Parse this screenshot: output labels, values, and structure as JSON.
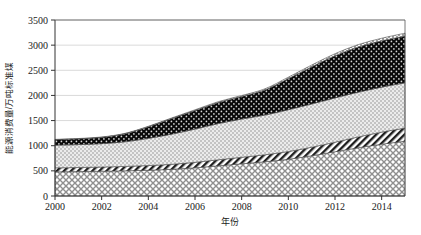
{
  "chart_data": {
    "type": "area",
    "title": "",
    "xlabel": "年份",
    "ylabel": "能源消费量/万吨标准煤",
    "x": [
      2000,
      2001,
      2002,
      2003,
      2004,
      2005,
      2006,
      2007,
      2008,
      2009,
      2010,
      2011,
      2012,
      2013,
      2014,
      2015
    ],
    "xlim": [
      2000,
      2015
    ],
    "ylim": [
      0,
      3500
    ],
    "yticks": [
      0,
      500,
      1000,
      1500,
      2000,
      2500,
      3000,
      3500
    ],
    "xticks": [
      2000,
      2002,
      2004,
      2006,
      2008,
      2010,
      2012,
      2014
    ],
    "xtick_labels": [
      "2000",
      "2002",
      "2004",
      "2006",
      "2008",
      "2010",
      "2012",
      "2014"
    ],
    "ytick_labels": [
      "0",
      "500",
      "1000",
      "1500",
      "2000",
      "2500",
      "3000",
      "3500"
    ],
    "grid": "horizontal",
    "legend": "none",
    "stacked": true,
    "series": [
      {
        "name": "layer-1-crosshatch",
        "pattern": "cross-hatch",
        "color": "#c9c9c9",
        "values": [
          480,
          485,
          492,
          500,
          512,
          530,
          560,
          600,
          640,
          680,
          730,
          800,
          880,
          960,
          1030,
          1090
        ]
      },
      {
        "name": "layer-2-diagonal-stripes",
        "pattern": "diagonal-stripes",
        "color": "#3a3a3a",
        "values": [
          80,
          82,
          84,
          88,
          94,
          100,
          110,
          120,
          130,
          140,
          155,
          170,
          190,
          215,
          240,
          260
        ]
      },
      {
        "name": "layer-3-light-dots",
        "pattern": "light-dotted",
        "color": "#d8d8d8",
        "values": [
          450,
          455,
          465,
          490,
          540,
          600,
          660,
          720,
          760,
          790,
          830,
          860,
          880,
          890,
          895,
          900
        ]
      },
      {
        "name": "layer-4-black-dots",
        "pattern": "dark-dotted",
        "color": "#0d0d0d",
        "values": [
          110,
          115,
          125,
          160,
          230,
          310,
          370,
          420,
          450,
          500,
          620,
          740,
          840,
          900,
          920,
          930
        ]
      },
      {
        "name": "layer-5-top-dotted",
        "pattern": "fine-dotted",
        "color": "#f2f2f2",
        "values": [
          6,
          6,
          7,
          8,
          10,
          12,
          14,
          16,
          18,
          22,
          28,
          34,
          40,
          46,
          52,
          58
        ]
      }
    ],
    "totals": [
      1126,
      1143,
      1173,
      1246,
      1386,
      1552,
      1714,
      1876,
      1998,
      2132,
      2363,
      2604,
      2830,
      3011,
      3137,
      3238
    ]
  }
}
